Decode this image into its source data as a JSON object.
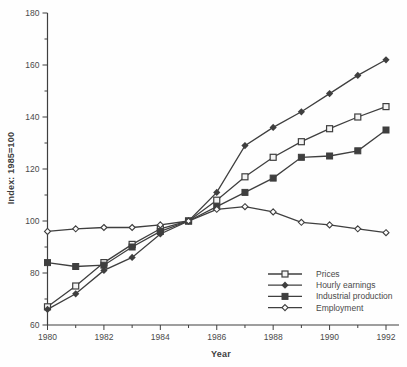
{
  "figure": {
    "background": "#fefefe",
    "ink_color": "#3f3f3f",
    "text_color": "#4a4a4a"
  },
  "chart_data": {
    "type": "line",
    "title": "",
    "xlabel": "Year",
    "ylabel": "Index: 1985=100",
    "x": [
      1980,
      1981,
      1982,
      1983,
      1984,
      1985,
      1986,
      1987,
      1988,
      1989,
      1990,
      1991,
      1992
    ],
    "xlim": [
      1980,
      1992
    ],
    "ylim": [
      60,
      180
    ],
    "y_major_ticks": [
      60,
      80,
      100,
      120,
      140,
      160,
      180
    ],
    "y_minor_ticks": [
      70,
      90,
      110,
      130,
      150,
      170
    ],
    "x_labeled_ticks": [
      1980,
      1982,
      1984,
      1986,
      1988,
      1990,
      1992
    ],
    "grid": "off",
    "legend_position": "inside-bottom-right",
    "series": [
      {
        "name": "Prices",
        "slug": "prices",
        "marker": "open-square",
        "values": [
          67,
          75,
          84,
          91,
          97,
          100,
          108,
          117,
          124.5,
          130.5,
          135.5,
          140,
          144
        ]
      },
      {
        "name": "Hourly earnings",
        "slug": "hourly-earnings",
        "marker": "filled-diamond",
        "values": [
          66,
          72,
          81,
          86,
          95,
          100,
          111,
          129,
          136,
          142,
          149,
          156,
          162
        ]
      },
      {
        "name": "Industrial production",
        "slug": "industrial-production",
        "marker": "filled-square",
        "values": [
          84,
          82.5,
          83,
          90,
          96,
          100,
          105.5,
          111,
          116.5,
          124.5,
          125,
          127,
          135
        ]
      },
      {
        "name": "Employment",
        "slug": "employment",
        "marker": "open-diamond",
        "values": [
          96,
          97,
          97.5,
          97.5,
          98.5,
          100,
          104.5,
          105.5,
          103.5,
          99.5,
          98.5,
          97,
          95.5
        ]
      }
    ]
  }
}
